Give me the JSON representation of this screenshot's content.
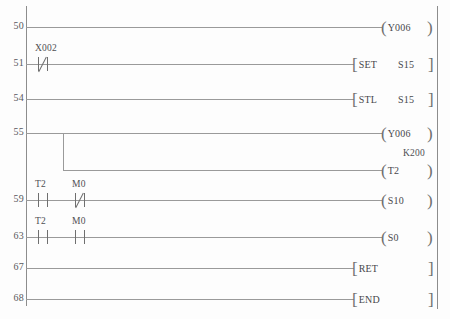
{
  "diagram": {
    "kind": "plc-ladder-logic",
    "left_rail_label": "",
    "right_rail_label": ""
  },
  "rungs": [
    {
      "step": "50",
      "contacts": [],
      "output": {
        "style": "coil",
        "name": "Y006",
        "preset": ""
      }
    },
    {
      "step": "51",
      "contacts": [
        {
          "label": "X002",
          "type": "nc"
        }
      ],
      "output": {
        "style": "bracket",
        "op": "SET",
        "arg": "S15"
      }
    },
    {
      "step": "54",
      "contacts": [],
      "output": {
        "style": "bracket",
        "op": "STL",
        "arg": "S15"
      }
    },
    {
      "step": "55",
      "contacts": [],
      "output": {
        "style": "coil",
        "name": "Y006",
        "preset": ""
      },
      "branch": {
        "style": "coil",
        "name": "T2",
        "preset": "K200"
      }
    },
    {
      "step": "59",
      "contacts": [
        {
          "label": "T2",
          "type": "no"
        },
        {
          "label": "M0",
          "type": "nc"
        }
      ],
      "output": {
        "style": "coil",
        "name": "S10",
        "preset": ""
      }
    },
    {
      "step": "63",
      "contacts": [
        {
          "label": "T2",
          "type": "no"
        },
        {
          "label": "M0",
          "type": "no"
        }
      ],
      "output": {
        "style": "coil",
        "name": "S0",
        "preset": ""
      }
    },
    {
      "step": "67",
      "contacts": [],
      "output": {
        "style": "bracket",
        "op": "RET",
        "arg": ""
      }
    },
    {
      "step": "68",
      "contacts": [],
      "output": {
        "style": "bracket",
        "op": "END",
        "arg": ""
      }
    }
  ],
  "glyphs": {
    "paren_open": "(",
    "paren_close": ")",
    "bracket_open": "[",
    "bracket_close": "]"
  },
  "colors": {
    "line": "#9a9a9a",
    "rail": "#8d8d8d",
    "text": "#47474b",
    "background": "#fdfdfd"
  }
}
